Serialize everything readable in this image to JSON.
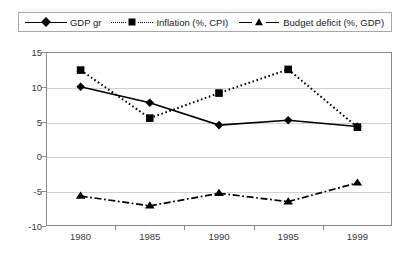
{
  "chart_data": {
    "type": "line",
    "title": "",
    "subtitle": "",
    "xlabel": "",
    "ylabel": "",
    "x": [
      1980,
      1985,
      1990,
      1995,
      1999
    ],
    "categories": [
      "1980",
      "1985",
      "1990",
      "1995",
      "1999"
    ],
    "xtick_labels": [
      "1980",
      "1985",
      "1990",
      "1995",
      "1999"
    ],
    "ytick_labels": [
      "15",
      "10",
      "5",
      "0",
      "-5",
      "-10"
    ],
    "ytick_values": [
      15,
      10,
      5,
      0,
      -5,
      -10
    ],
    "ylim": [
      -10,
      15
    ],
    "grid": "horizontal",
    "legend_position": "top",
    "series": [
      {
        "name": "GDP gr",
        "marker": "diamond",
        "line_style": "solid",
        "color": "#000000",
        "values": [
          10.0,
          7.7,
          4.5,
          5.2,
          4.3
        ]
      },
      {
        "name": "Inflation (%, CPI)",
        "marker": "square",
        "line_style": "dotted",
        "color": "#000000",
        "values": [
          12.4,
          5.5,
          9.1,
          12.5,
          4.2
        ]
      },
      {
        "name": "Budget deficit (%, GDP)",
        "marker": "triangle",
        "line_style": "dashdot",
        "color": "#000000",
        "values": [
          -5.7,
          -7.1,
          -5.3,
          -6.5,
          -3.8
        ]
      }
    ]
  },
  "legend": {
    "entries": [
      {
        "label": "GDP gr"
      },
      {
        "label": "Inflation (%, CPI)"
      },
      {
        "label": "Budget deficit (%, GDP)"
      }
    ]
  },
  "colors": {
    "series": "#000000",
    "grid": "#d2d2d2",
    "frame": "#8a8a8a",
    "legend_border": "#a8a8a8",
    "tick_text": "#3a3a3a",
    "background": "#ffffff"
  }
}
